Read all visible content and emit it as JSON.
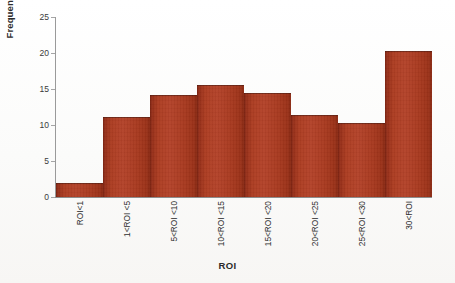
{
  "chart_data": {
    "type": "bar",
    "title": "",
    "xlabel": "ROI",
    "ylabel": "Frequency (%)",
    "categories": [
      "ROI<1",
      "1<ROI <5",
      "5<ROI <10",
      "10<ROI <15",
      "15<ROI <20",
      "20<ROI <25",
      "25<ROI <30",
      "30<ROI"
    ],
    "values": [
      1.9,
      11.1,
      14.1,
      15.5,
      14.4,
      11.4,
      10.3,
      20.3
    ],
    "ylim": [
      0,
      25
    ],
    "yticks": [
      0,
      5,
      10,
      15,
      20,
      25
    ],
    "ytick_labels": [
      "0",
      "5",
      "10",
      "15",
      "20",
      "25"
    ],
    "grid": false,
    "legend": false,
    "bar_gap": 0,
    "series_name": "Frequency (%)",
    "colors": {
      "bar_fill": "#ad3d22",
      "bar_edge_dark": "#7d2413",
      "axis_line": "#9a9a9a",
      "text": "#2b2b2b",
      "background": "#fefefe"
    }
  }
}
